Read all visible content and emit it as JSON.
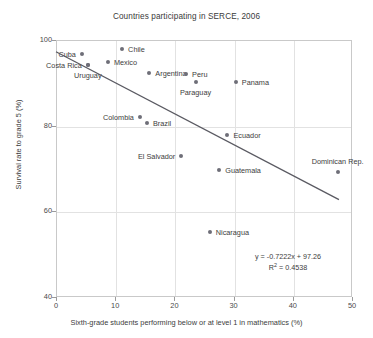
{
  "chart_data": {
    "type": "scatter",
    "title": "Countries participating in SERCE, 2006",
    "xlabel": "Sixth-grade students performing below or at level 1 in mathematics (%)",
    "ylabel": "Survival rate to grade 5 (%)",
    "xlim": [
      0,
      50
    ],
    "ylim": [
      40,
      100
    ],
    "xticks": [
      0,
      10,
      20,
      30,
      40,
      50
    ],
    "yticks": [
      40,
      60,
      80,
      100
    ],
    "grid": true,
    "legend": "none",
    "point_color": "#6e6e78",
    "trendline_color": "#5a5a62",
    "points": [
      {
        "label": "Cuba",
        "x": 4.2,
        "y": 97.0,
        "label_pos": "left"
      },
      {
        "label": "Costa Rica",
        "x": 5.2,
        "y": 94.4,
        "label_pos": "left"
      },
      {
        "label": "Uruguay",
        "x": 5.2,
        "y": 94.4,
        "label_pos": "below"
      },
      {
        "label": "Chile",
        "x": 11.0,
        "y": 98.2,
        "label_pos": "right"
      },
      {
        "label": "Mexico",
        "x": 8.6,
        "y": 95.0,
        "label_pos": "right"
      },
      {
        "label": "Argentina",
        "x": 15.6,
        "y": 92.6,
        "label_pos": "right"
      },
      {
        "label": "Peru",
        "x": 21.8,
        "y": 92.4,
        "label_pos": "right"
      },
      {
        "label": "Paraguay",
        "x": 23.4,
        "y": 90.5,
        "label_pos": "below"
      },
      {
        "label": "Panama",
        "x": 30.2,
        "y": 90.4,
        "label_pos": "right"
      },
      {
        "label": "Colombia",
        "x": 14.0,
        "y": 82.2,
        "label_pos": "left"
      },
      {
        "label": "Brazil",
        "x": 15.2,
        "y": 80.8,
        "label_pos": "right"
      },
      {
        "label": "Ecuador",
        "x": 28.8,
        "y": 78.0,
        "label_pos": "right"
      },
      {
        "label": "El Salvador",
        "x": 21.0,
        "y": 73.2,
        "label_pos": "left"
      },
      {
        "label": "Guatemala",
        "x": 27.4,
        "y": 70.0,
        "label_pos": "right"
      },
      {
        "label": "Dominican Rep.",
        "x": 47.4,
        "y": 69.5,
        "label_pos": "above"
      },
      {
        "label": "Nicaragua",
        "x": 25.8,
        "y": 55.5,
        "label_pos": "right"
      }
    ],
    "trendline": {
      "slope": -0.7222,
      "intercept": 97.26,
      "x_start": 0.0,
      "x_end": 47.8,
      "equation": "y = -0.7222x + 97.26",
      "r2_prefix": "R",
      "r2_exponent": "2",
      "r2_suffix": " = 0.4538"
    }
  }
}
